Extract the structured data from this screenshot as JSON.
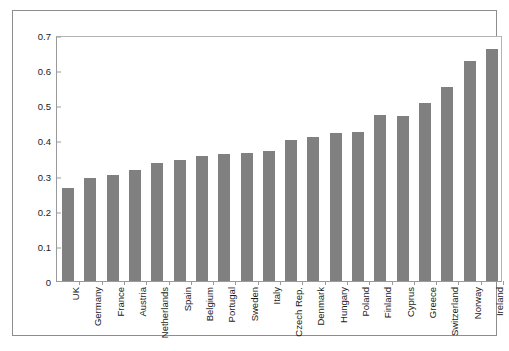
{
  "chart_data": {
    "type": "bar",
    "title": "",
    "subtitle": "",
    "xlabel": "",
    "ylabel": "",
    "ylim": [
      0,
      0.7
    ],
    "yticks": [
      "0",
      "0.1",
      "0.2",
      "0.3",
      "0.4",
      "0.5",
      "0.6",
      "0.7"
    ],
    "ytick_values": [
      0,
      0.1,
      0.2,
      0.3,
      0.4,
      0.5,
      0.6,
      0.7
    ],
    "grid": false,
    "legend": null,
    "bar_color": "#808080",
    "categories": [
      "UK",
      "Germany",
      "France",
      "Austria",
      "Netherlands",
      "Spain",
      "Belgium",
      "Portugal",
      "Sweden",
      "Italy",
      "Czech Rep.",
      "Denmark",
      "Hungary",
      "Poland",
      "Finland",
      "Cyprus",
      "Greece",
      "Switzerland",
      "Norway",
      "Ireland"
    ],
    "values": [
      0.265,
      0.294,
      0.303,
      0.315,
      0.337,
      0.345,
      0.357,
      0.362,
      0.365,
      0.371,
      0.4,
      0.411,
      0.421,
      0.425,
      0.471,
      0.47,
      0.506,
      0.552,
      0.625,
      0.659
    ]
  }
}
